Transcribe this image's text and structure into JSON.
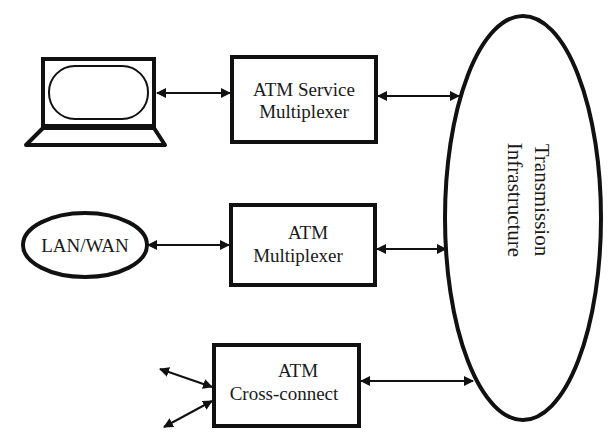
{
  "diagram": {
    "type": "network-architecture",
    "nodes": {
      "workstation": {
        "label": "",
        "icon": "laptop-icon"
      },
      "service_mux": {
        "line1": "ATM Service",
        "line2": "Multiplexer"
      },
      "lan_wan": {
        "label": "LAN/WAN"
      },
      "atm_mux": {
        "line1": "ATM",
        "line2": "Multiplexer"
      },
      "cross_connect": {
        "line1": "ATM",
        "line2": "Cross-connect"
      },
      "transmission": {
        "line1": "Transmission",
        "line2": "Infrastructure"
      }
    },
    "edges": [
      {
        "from": "workstation",
        "to": "service_mux",
        "style": "bidirectional"
      },
      {
        "from": "service_mux",
        "to": "transmission",
        "style": "bidirectional"
      },
      {
        "from": "lan_wan",
        "to": "atm_mux",
        "style": "bidirectional"
      },
      {
        "from": "atm_mux",
        "to": "transmission",
        "style": "bidirectional"
      },
      {
        "from": "external-1",
        "to": "cross_connect",
        "style": "bidirectional"
      },
      {
        "from": "external-2",
        "to": "cross_connect",
        "style": "bidirectional"
      },
      {
        "from": "cross_connect",
        "to": "transmission",
        "style": "bidirectional"
      }
    ],
    "colors": {
      "stroke": "#111111",
      "background": "#ffffff",
      "text": "#1a1a1a"
    }
  }
}
